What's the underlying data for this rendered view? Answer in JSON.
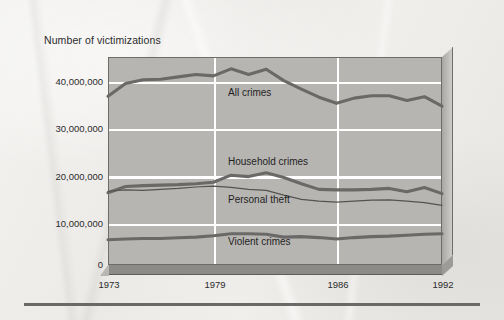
{
  "figure": {
    "axis_title": "Number of victimizations",
    "series_labels": {
      "all_crimes": "All crimes",
      "household_crimes": "Household crimes",
      "personal_theft": "Personal theft",
      "violent_crimes": "Violent crimes"
    },
    "y_ticks": [
      "40,000,000",
      "30,000,000",
      "20,000,000",
      "10,000,000",
      "0"
    ],
    "x_ticks": [
      "1973",
      "1979",
      "1986",
      "1992"
    ],
    "colors": {
      "plot_background": "#b7b5b2",
      "gridline": "#ffffff",
      "line_thick": "#6b6967",
      "line_thin": "#55534f",
      "frame": "#6e6c69",
      "base_3d": "#8d8b88",
      "page": "#efedea",
      "text": "#2b2b2b"
    }
  },
  "chart_data": {
    "type": "line",
    "title": "",
    "subtitle": "",
    "xlabel": "",
    "ylabel": "Number of victimizations",
    "xlim": [
      1973,
      1992
    ],
    "ylim": [
      0,
      44000000
    ],
    "grid": true,
    "legend_position": "inline-annotations",
    "x_tick_labels": [
      "1973",
      "1979",
      "1986",
      "1992"
    ],
    "y_tick_labels": [
      "0",
      "10,000,000",
      "20,000,000",
      "30,000,000",
      "40,000,000"
    ],
    "y_tick_values": [
      0,
      10000000,
      20000000,
      30000000,
      40000000
    ],
    "x": [
      1973,
      1974,
      1975,
      1976,
      1977,
      1978,
      1979,
      1980,
      1981,
      1982,
      1983,
      1984,
      1985,
      1986,
      1987,
      1988,
      1989,
      1990,
      1991,
      1992
    ],
    "series": [
      {
        "name": "All crimes",
        "style": "thick",
        "values": [
          35700000,
          38400000,
          39200000,
          39300000,
          39800000,
          40300000,
          40000000,
          41500000,
          40300000,
          41400000,
          39000000,
          37200000,
          35500000,
          34200000,
          35300000,
          35800000,
          35800000,
          34800000,
          35600000,
          33600000
        ]
      },
      {
        "name": "Household crimes",
        "style": "thick",
        "values": [
          15300000,
          16600000,
          16800000,
          16900000,
          17000000,
          17200000,
          17500000,
          19000000,
          18700000,
          19500000,
          18500000,
          17200000,
          16000000,
          15900000,
          15900000,
          16000000,
          16200000,
          15500000,
          16400000,
          15100000
        ]
      },
      {
        "name": "Personal theft",
        "style": "thin",
        "values": [
          15600000,
          15900000,
          15800000,
          16000000,
          16200000,
          16500000,
          16700000,
          16400000,
          16000000,
          15800000,
          14800000,
          13900000,
          13500000,
          13300000,
          13500000,
          13700000,
          13800000,
          13500000,
          13200000,
          12600000
        ]
      },
      {
        "name": "Violent crimes",
        "style": "thick",
        "values": [
          5350000,
          5500000,
          5600000,
          5600000,
          5750000,
          5900000,
          6200000,
          6600000,
          6600000,
          6500000,
          5900000,
          6000000,
          5800000,
          5500000,
          5800000,
          6000000,
          6100000,
          6300000,
          6500000,
          6600000
        ]
      }
    ]
  }
}
